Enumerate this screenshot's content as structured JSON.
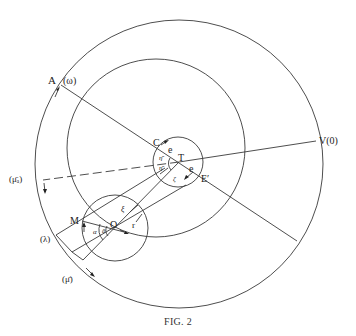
{
  "caption": "FIG. 2",
  "labels": {
    "A": "A",
    "omega": "(ω)",
    "C": "C",
    "e_upper": "e",
    "T": "T",
    "e_lower": "e",
    "E_prime": "E′",
    "V0": "V(0)",
    "mu_bar_a": "(μ̄ₐ)",
    "M": "M",
    "O": "O",
    "lambda": "(λ)",
    "mu_bar": "(μ̄)",
    "xi": "ξ",
    "r": "r",
    "alpha": "α",
    "alpha_prime": "ᾱ",
    "eta_upper": "η̄",
    "eta_lower": "η̄",
    "zeta": "ζ"
  },
  "geometry": {
    "outer_circle": {
      "cx": 179,
      "cy": 164,
      "r": 144
    },
    "deferent_circle": {
      "cx": 156,
      "cy": 148,
      "r": 89
    },
    "equant_circle_T": {
      "cx": 178,
      "cy": 162,
      "r": 25
    },
    "epicycle_circle_O": {
      "cx": 115,
      "cy": 228,
      "r": 33
    }
  },
  "colors": {
    "line": "#3a3a3a",
    "text": "#222222",
    "background": "#ffffff"
  }
}
